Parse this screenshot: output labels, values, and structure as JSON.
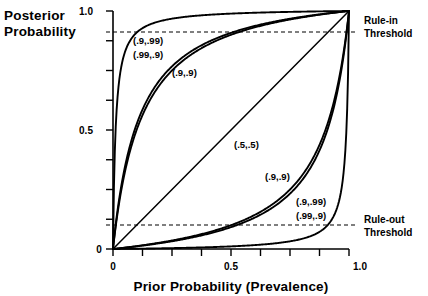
{
  "figure": {
    "background": "#ffffff",
    "ink_color": "#000000"
  },
  "axes": {
    "ylabel_line1": "Posterior",
    "ylabel_line2": "Probability",
    "xlabel": "Prior Probability (Prevalence)",
    "yticks": [
      "0",
      "0.5",
      "1.0"
    ],
    "xticks": [
      "0",
      "0.5",
      "1.0"
    ]
  },
  "annotations": {
    "rule_in_line1": "Rule-in",
    "rule_in_line2": "Threshold",
    "rule_out_line1": "Rule-out",
    "rule_out_line2": "Threshold",
    "c_upper_a": "(.9,.99)",
    "c_upper_b": "(.99,.9)",
    "c_upper_c": "(.9,.9)",
    "c_diag": "(.5,.5)",
    "c_lower_a": "(.9,.9)",
    "c_lower_b": "(.9,.99)",
    "c_lower_c": "(.99,.9)"
  },
  "chart_data": {
    "type": "line",
    "title": "",
    "xlabel": "Prior Probability (Prevalence)",
    "ylabel": "Posterior Probability",
    "xlim": [
      0,
      1
    ],
    "ylim": [
      0,
      1
    ],
    "xticks": [
      0,
      0.125,
      0.25,
      0.375,
      0.5,
      0.625,
      0.75,
      0.875,
      1.0
    ],
    "xtick_labels": [
      "0",
      "",
      "",
      "",
      "0.5",
      "",
      "",
      "",
      "1.0"
    ],
    "yticks": [
      0,
      0.125,
      0.25,
      0.375,
      0.5,
      0.625,
      0.75,
      0.875,
      1.0
    ],
    "ytick_labels": [
      "0",
      "",
      "",
      "",
      "0.5",
      "",
      "",
      "",
      "1.0"
    ],
    "grid": false,
    "legend": "none",
    "hlines": [
      {
        "name": "Rule-in Threshold",
        "y": 0.92,
        "style": "dashed"
      },
      {
        "name": "Rule-out Threshold",
        "y": 0.1,
        "style": "dashed"
      }
    ],
    "series": [
      {
        "name": "Positive test, sens=.9 spec=.99",
        "label": "(.9,.99)",
        "group": "upper",
        "likelihood_ratio": 90,
        "x": [
          0,
          0.01,
          0.02,
          0.04,
          0.06,
          0.08,
          0.1,
          0.15,
          0.2,
          0.3,
          0.4,
          0.5,
          0.6,
          0.7,
          0.8,
          0.9,
          1.0
        ],
        "y": [
          0,
          0.476,
          0.647,
          0.789,
          0.852,
          0.887,
          0.909,
          0.941,
          0.957,
          0.975,
          0.984,
          0.989,
          0.993,
          0.995,
          0.997,
          0.999,
          1.0
        ]
      },
      {
        "name": "Positive test, sens=.99 spec=.9",
        "label": "(.99,.9)",
        "group": "upper",
        "likelihood_ratio": 9.9,
        "x": [
          0,
          0.01,
          0.02,
          0.04,
          0.06,
          0.08,
          0.1,
          0.15,
          0.2,
          0.3,
          0.4,
          0.5,
          0.6,
          0.7,
          0.8,
          0.9,
          1.0
        ],
        "y": [
          0,
          0.091,
          0.168,
          0.292,
          0.387,
          0.463,
          0.524,
          0.636,
          0.712,
          0.809,
          0.868,
          0.908,
          0.937,
          0.958,
          0.975,
          0.989,
          1.0
        ]
      },
      {
        "name": "Positive test, sens=.9 spec=.9",
        "label": "(.9,.9)",
        "group": "upper",
        "likelihood_ratio": 9,
        "x": [
          0,
          0.01,
          0.02,
          0.04,
          0.06,
          0.08,
          0.1,
          0.15,
          0.2,
          0.3,
          0.4,
          0.5,
          0.6,
          0.7,
          0.8,
          0.9,
          1.0
        ],
        "y": [
          0,
          0.083,
          0.155,
          0.273,
          0.365,
          0.439,
          0.5,
          0.614,
          0.692,
          0.794,
          0.857,
          0.9,
          0.931,
          0.955,
          0.973,
          0.988,
          1.0
        ]
      },
      {
        "name": "No information",
        "label": "(.5,.5)",
        "group": "diagonal",
        "likelihood_ratio": 1,
        "x": [
          0,
          1.0
        ],
        "y": [
          0,
          1.0
        ]
      },
      {
        "name": "Negative test, sens=.9 spec=.9",
        "label": "(.9,.9)",
        "group": "lower",
        "likelihood_ratio": 0.1111,
        "x": [
          0,
          0.1,
          0.2,
          0.3,
          0.4,
          0.5,
          0.6,
          0.7,
          0.8,
          0.9,
          0.94,
          0.96,
          0.98,
          0.99,
          1.0
        ],
        "y": [
          0,
          0.012,
          0.027,
          0.045,
          0.069,
          0.1,
          0.143,
          0.206,
          0.308,
          0.5,
          0.635,
          0.727,
          0.845,
          0.917,
          1.0
        ]
      },
      {
        "name": "Negative test, sens=.99 spec=.9",
        "label": "(.99,.9)",
        "group": "lower",
        "likelihood_ratio": 0.0111,
        "x": [
          0,
          0.1,
          0.2,
          0.3,
          0.4,
          0.5,
          0.6,
          0.7,
          0.8,
          0.9,
          0.94,
          0.96,
          0.98,
          0.99,
          1.0
        ],
        "y": [
          0,
          0.0012,
          0.0028,
          0.0047,
          0.0073,
          0.011,
          0.0164,
          0.0252,
          0.0426,
          0.0909,
          0.148,
          0.21,
          0.352,
          0.524,
          1.0
        ]
      },
      {
        "name": "Negative test, sens=.9 spec=.99",
        "label": "(.9,.99)",
        "group": "lower",
        "likelihood_ratio": 0.101,
        "x": [
          0,
          0.1,
          0.2,
          0.3,
          0.4,
          0.5,
          0.6,
          0.7,
          0.8,
          0.9,
          0.94,
          0.96,
          0.98,
          0.99,
          1.0
        ],
        "y": [
          0,
          0.011,
          0.025,
          0.041,
          0.063,
          0.092,
          0.132,
          0.191,
          0.288,
          0.476,
          0.613,
          0.708,
          0.832,
          0.909,
          1.0
        ]
      }
    ]
  }
}
